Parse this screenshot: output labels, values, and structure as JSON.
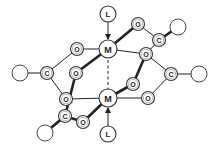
{
  "diagram": {
    "nodes": [
      {
        "id": "L1",
        "label": "L",
        "kind": "ligand"
      },
      {
        "id": "M1",
        "label": "M",
        "kind": "metal"
      },
      {
        "id": "M2",
        "label": "M",
        "kind": "metal"
      },
      {
        "id": "L2",
        "label": "L",
        "kind": "ligand"
      },
      {
        "id": "O1",
        "label": "O",
        "kind": "oxygen"
      },
      {
        "id": "O2",
        "label": "O",
        "kind": "oxygen"
      },
      {
        "id": "O3",
        "label": "O",
        "kind": "oxygen"
      },
      {
        "id": "O4",
        "label": "O",
        "kind": "oxygen"
      },
      {
        "id": "O5",
        "label": "O",
        "kind": "oxygen"
      },
      {
        "id": "O6",
        "label": "O",
        "kind": "oxygen"
      },
      {
        "id": "O7",
        "label": "O",
        "kind": "oxygen"
      },
      {
        "id": "O8",
        "label": "O",
        "kind": "oxygen"
      },
      {
        "id": "C1",
        "label": "C",
        "kind": "carbon"
      },
      {
        "id": "C2",
        "label": "C",
        "kind": "carbon"
      },
      {
        "id": "C3",
        "label": "C",
        "kind": "carbon"
      },
      {
        "id": "C4",
        "label": "C",
        "kind": "carbon"
      },
      {
        "id": "R1",
        "label": "",
        "kind": "substituent"
      },
      {
        "id": "R2",
        "label": "",
        "kind": "substituent"
      },
      {
        "id": "R3",
        "label": "",
        "kind": "substituent"
      },
      {
        "id": "R4",
        "label": "",
        "kind": "substituent"
      }
    ],
    "edges": [
      {
        "from": "L1",
        "to": "M1",
        "style": "arrow"
      },
      {
        "from": "L2",
        "to": "M2",
        "style": "arrow"
      },
      {
        "from": "M1",
        "to": "M2",
        "style": "dashed"
      },
      {
        "from": "M1",
        "to": "O1",
        "style": "thin"
      },
      {
        "from": "O1",
        "to": "C1",
        "style": "thin"
      },
      {
        "from": "C1",
        "to": "R1",
        "style": "thin"
      },
      {
        "from": "C1",
        "to": "O5",
        "style": "thin"
      },
      {
        "from": "O5",
        "to": "M2",
        "style": "thin"
      },
      {
        "from": "M1",
        "to": "O2",
        "style": "thick"
      },
      {
        "from": "O2",
        "to": "C3",
        "style": "thick"
      },
      {
        "from": "C3",
        "to": "R3",
        "style": "thick"
      },
      {
        "from": "C3",
        "to": "O6",
        "style": "thick"
      },
      {
        "from": "O6",
        "to": "M2",
        "style": "thick"
      },
      {
        "from": "M1",
        "to": "O3",
        "style": "thick"
      },
      {
        "from": "O3",
        "to": "C4",
        "style": "thin"
      },
      {
        "from": "C4",
        "to": "R4",
        "style": "thick"
      },
      {
        "from": "C4",
        "to": "O4",
        "style": "thin"
      },
      {
        "from": "O4",
        "to": "O7",
        "style": "thick"
      },
      {
        "from": "O7",
        "to": "M2",
        "style": "thick"
      },
      {
        "from": "M1",
        "to": "O4",
        "style": "thin"
      },
      {
        "from": "O4",
        "to": "C2",
        "style": "thin"
      },
      {
        "from": "C2",
        "to": "R2",
        "style": "thin"
      },
      {
        "from": "C2",
        "to": "O8",
        "style": "thin"
      },
      {
        "from": "O8",
        "to": "M2",
        "style": "thin"
      }
    ]
  }
}
